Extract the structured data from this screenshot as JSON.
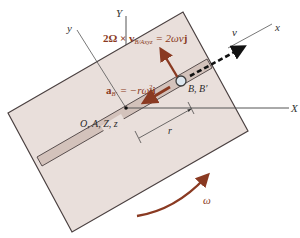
{
  "figure": {
    "colors": {
      "plate_fill": "#e9dfdb",
      "plate_edge": "#4a4040",
      "slot_fill": "#d3c2bb",
      "vector_color": "#8a3a22",
      "axis_color": "#555555",
      "dashed_arrow": "#111111",
      "ball_fill": "#dde6ee"
    },
    "axes": {
      "inertial_X": "X",
      "inertial_Y": "Y",
      "rotating_x": "x",
      "rotating_y": "y"
    },
    "labels": {
      "origin": "O, A, Z, z",
      "point_B": "B, B′",
      "radius": "r",
      "velocity": "v",
      "angular_velocity": "ω"
    },
    "equations": {
      "coriolis": {
        "lhs_prefix": "2Ω × v",
        "lhs_subscript": "B/Axyz",
        "rhs": "= 2ωv",
        "unit_vector": "j"
      },
      "centripetal": {
        "lhs_prefix": "a",
        "lhs_subscript": "B′",
        "rhs": "= −rω",
        "exponent": "2",
        "unit_vector": "i"
      }
    }
  }
}
